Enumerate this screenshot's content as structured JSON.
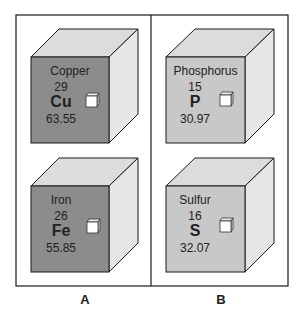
{
  "colors": {
    "metal_front": "#8c8c8c",
    "nonmetal_front": "#c8c8c8",
    "top": "#dcdcdc",
    "side": "#e6e6e6",
    "stroke": "#1a1a1a"
  },
  "panels": [
    {
      "label": "A",
      "elements": [
        {
          "name": "Copper",
          "number": "29",
          "symbol": "Cu",
          "mass": "63.55"
        },
        {
          "name": "Iron",
          "number": "26",
          "symbol": "Fe",
          "mass": "55.85"
        }
      ]
    },
    {
      "label": "B",
      "elements": [
        {
          "name": "Phosphorus",
          "number": "15",
          "symbol": "P",
          "mass": "30.97"
        },
        {
          "name": "Sulfur",
          "number": "16",
          "symbol": "S",
          "mass": "32.07"
        }
      ]
    }
  ]
}
